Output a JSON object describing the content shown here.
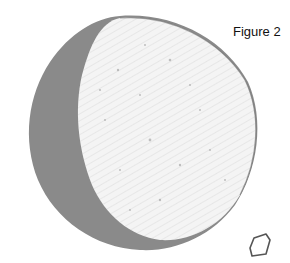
{
  "figure": {
    "label": "Figure 2",
    "colors": {
      "shadow": "#8a8a8a",
      "lit": "#f4f4f4",
      "outline": "#555555",
      "background": "#ffffff"
    }
  }
}
